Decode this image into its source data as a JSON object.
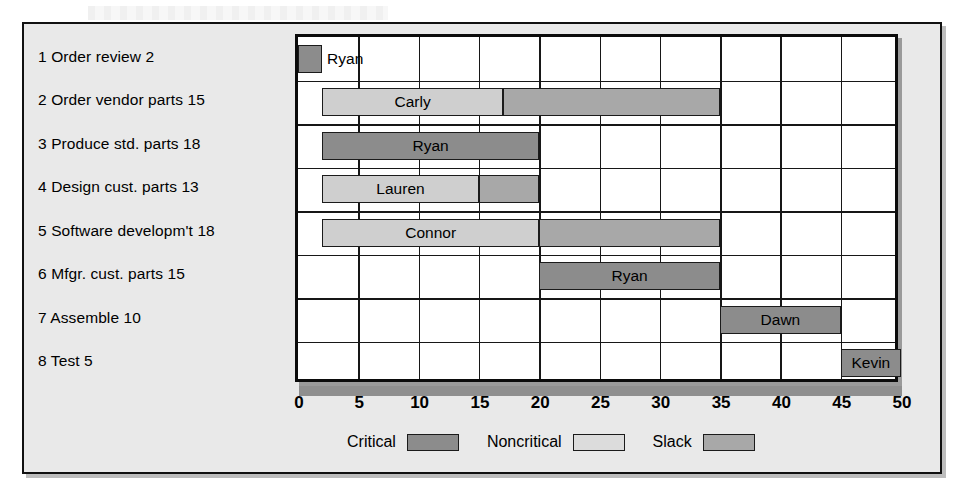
{
  "chart_data": {
    "type": "bar",
    "chart_kind": "gantt",
    "title": "",
    "xlabel": "",
    "ylabel": "",
    "xlim": [
      0,
      50
    ],
    "xticks": [
      0,
      5,
      10,
      15,
      20,
      25,
      30,
      35,
      40,
      45,
      50
    ],
    "grid": true,
    "legend_position": "bottom",
    "colors": {
      "critical": "#8c8c8c",
      "noncritical": "#cfcfcf",
      "slack": "#a8a8a8",
      "plot_background": "#ffffff",
      "figure_background": "#e9e9e9",
      "outline": "#111111"
    },
    "legend": [
      {
        "label": "Critical",
        "swatch": "critical"
      },
      {
        "label": "Noncritical",
        "swatch": "noncritical"
      },
      {
        "label": "Slack",
        "swatch": "slack"
      }
    ],
    "categories": [
      "1 Order review 2",
      "2 Order vendor parts 15",
      "3 Produce std. parts 18",
      "4 Design cust. parts 13",
      "5 Software developm't 18",
      "6 Mfgr. cust. parts 15",
      "7 Assemble 10",
      "8 Test 5"
    ],
    "tasks": [
      {
        "id": 1,
        "name": "Order review",
        "duration": 2,
        "label": "1 Order review 2",
        "resource": "Ryan",
        "name_placement": "outside",
        "segments": [
          {
            "kind": "critical",
            "start": 0,
            "end": 2
          }
        ]
      },
      {
        "id": 2,
        "name": "Order vendor parts",
        "duration": 15,
        "label": "2 Order vendor parts 15",
        "resource": "Carly",
        "name_placement": "inside",
        "segments": [
          {
            "kind": "noncritical",
            "start": 2,
            "end": 17
          },
          {
            "kind": "slack",
            "start": 17,
            "end": 35
          }
        ]
      },
      {
        "id": 3,
        "name": "Produce std. parts",
        "duration": 18,
        "label": "3 Produce std. parts 18",
        "resource": "Ryan",
        "name_placement": "inside",
        "segments": [
          {
            "kind": "critical",
            "start": 2,
            "end": 20
          }
        ]
      },
      {
        "id": 4,
        "name": "Design cust. parts",
        "duration": 13,
        "label": "4 Design cust. parts 13",
        "resource": "Lauren",
        "name_placement": "inside",
        "segments": [
          {
            "kind": "noncritical",
            "start": 2,
            "end": 15
          },
          {
            "kind": "slack",
            "start": 15,
            "end": 20
          }
        ]
      },
      {
        "id": 5,
        "name": "Software developm't",
        "duration": 18,
        "label": "5 Software developm't 18",
        "resource": "Connor",
        "name_placement": "inside",
        "segments": [
          {
            "kind": "noncritical",
            "start": 2,
            "end": 20
          },
          {
            "kind": "slack",
            "start": 20,
            "end": 35
          }
        ]
      },
      {
        "id": 6,
        "name": "Mfgr. cust. parts",
        "duration": 15,
        "label": "6 Mfgr. cust. parts 15",
        "resource": "Ryan",
        "name_placement": "inside",
        "segments": [
          {
            "kind": "critical",
            "start": 20,
            "end": 35
          }
        ]
      },
      {
        "id": 7,
        "name": "Assemble",
        "duration": 10,
        "label": "7 Assemble 10",
        "resource": "Dawn",
        "name_placement": "inside",
        "segments": [
          {
            "kind": "critical",
            "start": 35,
            "end": 45
          }
        ]
      },
      {
        "id": 8,
        "name": "Test",
        "duration": 5,
        "label": "8 Test 5",
        "resource": "Kevin",
        "name_placement": "inside",
        "segments": [
          {
            "kind": "critical",
            "start": 45,
            "end": 50
          }
        ]
      }
    ]
  }
}
